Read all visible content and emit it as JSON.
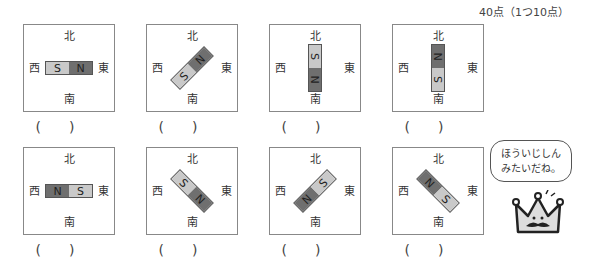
{
  "header": {
    "score": "40点（1つ10点）"
  },
  "directions": {
    "north": "北",
    "south": "南",
    "west": "西",
    "east": "東"
  },
  "paren": {
    "open": "(",
    "close": ")"
  },
  "cards": [
    {
      "id": 1,
      "row": 1,
      "angle": 0,
      "poles": [
        "S",
        "N"
      ]
    },
    {
      "id": 2,
      "row": 1,
      "angle": -45,
      "poles": [
        "S",
        "N"
      ]
    },
    {
      "id": 3,
      "row": 1,
      "angle": 90,
      "poles": [
        "S",
        "N"
      ]
    },
    {
      "id": 4,
      "row": 1,
      "angle": -90,
      "poles": [
        "S",
        "N"
      ]
    },
    {
      "id": 5,
      "row": 2,
      "angle": 0,
      "poles": [
        "N",
        "S"
      ]
    },
    {
      "id": 6,
      "row": 2,
      "angle": 45,
      "poles": [
        "S",
        "N"
      ]
    },
    {
      "id": 7,
      "row": 2,
      "angle": -45,
      "poles": [
        "N",
        "S"
      ]
    },
    {
      "id": 8,
      "row": 2,
      "angle": 45,
      "poles": [
        "N",
        "S"
      ]
    }
  ],
  "speech_bubble": {
    "line1": "ほういじしん",
    "line2": "みたいだね。"
  },
  "colors": {
    "S_pole": "#c9c9c9",
    "N_pole": "#6f6f6f",
    "border": "#888888"
  }
}
